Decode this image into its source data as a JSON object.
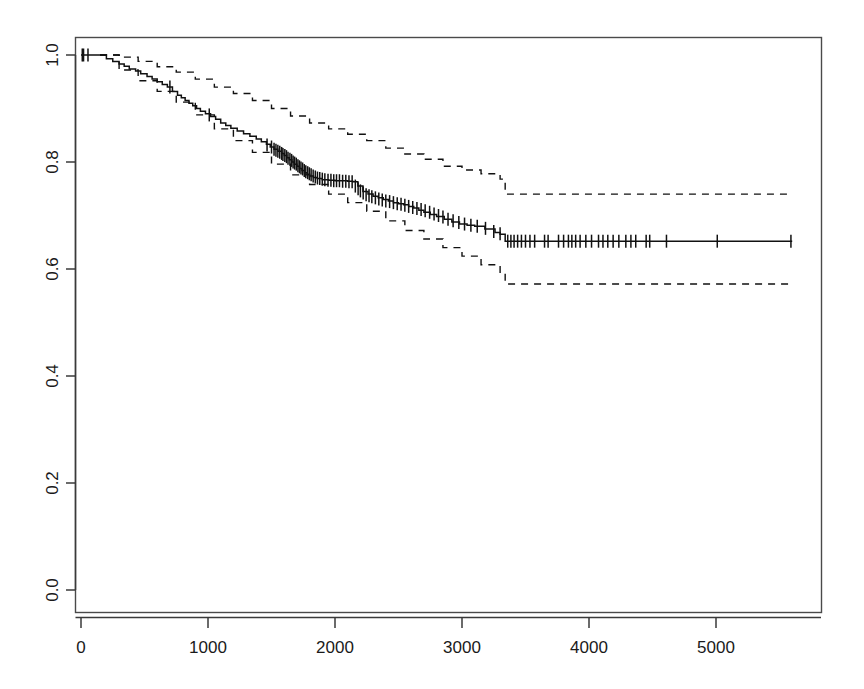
{
  "figure": {
    "title": "",
    "width": 864,
    "height": 689,
    "background": "#ffffff",
    "line_color": "#111111",
    "axis_color": "#3a3a3a"
  },
  "axes": {
    "x_ticks": [
      "0",
      "1000",
      "2000",
      "3000",
      "4000",
      "5000"
    ],
    "y_ticks": [
      "0.0",
      "0.2",
      "0.4",
      "0.6",
      "0.8",
      "1.0"
    ],
    "xlabel": "",
    "ylabel": ""
  },
  "chart_data": {
    "type": "line",
    "title": "",
    "xlabel": "",
    "ylabel": "",
    "xlim": [
      -180,
      5700
    ],
    "ylim": [
      -0.035,
      1.06
    ],
    "grid": false,
    "legend": null,
    "x_ticks": [
      0,
      1000,
      2000,
      3000,
      4000,
      5000
    ],
    "y_ticks": [
      0.0,
      0.2,
      0.4,
      0.6,
      0.8,
      1.0
    ],
    "series": [
      {
        "name": "survival",
        "style": "step",
        "linestyle": "solid",
        "x": [
          0,
          150,
          200,
          250,
          300,
          340,
          380,
          430,
          470,
          520,
          560,
          600,
          640,
          680,
          720,
          760,
          790,
          820,
          850,
          880,
          910,
          940,
          980,
          1020,
          1060,
          1100,
          1140,
          1180,
          1230,
          1280,
          1330,
          1380,
          1420,
          1460,
          1490,
          1520,
          1550,
          1580,
          1600,
          1620,
          1640,
          1660,
          1680,
          1700,
          1720,
          1740,
          1760,
          1780,
          1800,
          1830,
          1860,
          1900,
          1950,
          2000,
          2050,
          2100,
          2140,
          2180,
          2220,
          2260,
          2300,
          2340,
          2380,
          2420,
          2460,
          2500,
          2540,
          2580,
          2620,
          2660,
          2700,
          2750,
          2800,
          2860,
          2920,
          2980,
          3040,
          3100,
          3180,
          3260,
          3300,
          3340,
          5600
        ],
        "y": [
          1.0,
          1.0,
          0.993,
          0.988,
          0.983,
          0.979,
          0.974,
          0.97,
          0.965,
          0.96,
          0.955,
          0.95,
          0.945,
          0.94,
          0.932,
          0.925,
          0.92,
          0.915,
          0.91,
          0.905,
          0.9,
          0.895,
          0.89,
          0.885,
          0.88,
          0.873,
          0.868,
          0.863,
          0.858,
          0.853,
          0.848,
          0.843,
          0.838,
          0.833,
          0.828,
          0.824,
          0.82,
          0.816,
          0.812,
          0.808,
          0.804,
          0.8,
          0.796,
          0.792,
          0.788,
          0.784,
          0.78,
          0.777,
          0.774,
          0.771,
          0.769,
          0.767,
          0.766,
          0.765,
          0.765,
          0.764,
          0.763,
          0.755,
          0.745,
          0.74,
          0.736,
          0.733,
          0.73,
          0.727,
          0.724,
          0.722,
          0.72,
          0.717,
          0.714,
          0.71,
          0.706,
          0.702,
          0.698,
          0.693,
          0.688,
          0.684,
          0.682,
          0.68,
          0.675,
          0.668,
          0.665,
          0.652,
          0.652
        ]
      },
      {
        "name": "upper_95_ci",
        "style": "step",
        "linestyle": "dashed",
        "x": [
          150,
          300,
          450,
          600,
          750,
          900,
          1050,
          1200,
          1350,
          1500,
          1650,
          1800,
          1950,
          2100,
          2250,
          2400,
          2550,
          2700,
          2850,
          3000,
          3150,
          3300,
          3340,
          5600
        ],
        "y": [
          1.0,
          0.996,
          0.988,
          0.978,
          0.968,
          0.955,
          0.94,
          0.928,
          0.915,
          0.9,
          0.886,
          0.873,
          0.862,
          0.852,
          0.84,
          0.826,
          0.815,
          0.805,
          0.792,
          0.785,
          0.778,
          0.768,
          0.74,
          0.74
        ]
      },
      {
        "name": "lower_95_ci",
        "style": "step",
        "linestyle": "dashed",
        "x": [
          150,
          300,
          450,
          600,
          750,
          900,
          1050,
          1200,
          1350,
          1500,
          1650,
          1800,
          1950,
          2100,
          2250,
          2400,
          2550,
          2700,
          2850,
          3000,
          3150,
          3300,
          3340,
          5600
        ],
        "y": [
          1.0,
          0.972,
          0.952,
          0.932,
          0.912,
          0.888,
          0.862,
          0.84,
          0.818,
          0.796,
          0.776,
          0.758,
          0.74,
          0.724,
          0.708,
          0.69,
          0.672,
          0.656,
          0.64,
          0.624,
          0.608,
          0.592,
          0.572,
          0.572
        ]
      }
    ],
    "censoring_marks": {
      "label": "censored observations",
      "marker": "+",
      "points": [
        [
          10,
          1.0
        ],
        [
          20,
          1.0
        ],
        [
          55,
          1.0
        ],
        [
          700,
          0.94
        ],
        [
          1010,
          0.888
        ],
        [
          1465,
          0.832
        ],
        [
          1500,
          0.828
        ],
        [
          1520,
          0.824
        ],
        [
          1535,
          0.822
        ],
        [
          1550,
          0.82
        ],
        [
          1565,
          0.818
        ],
        [
          1580,
          0.816
        ],
        [
          1590,
          0.814
        ],
        [
          1605,
          0.812
        ],
        [
          1618,
          0.81
        ],
        [
          1630,
          0.807
        ],
        [
          1645,
          0.805
        ],
        [
          1658,
          0.803
        ],
        [
          1670,
          0.8
        ],
        [
          1682,
          0.798
        ],
        [
          1695,
          0.796
        ],
        [
          1708,
          0.793
        ],
        [
          1720,
          0.791
        ],
        [
          1732,
          0.789
        ],
        [
          1745,
          0.787
        ],
        [
          1758,
          0.784
        ],
        [
          1770,
          0.782
        ],
        [
          1785,
          0.78
        ],
        [
          1798,
          0.778
        ],
        [
          1812,
          0.776
        ],
        [
          1828,
          0.774
        ],
        [
          1845,
          0.772
        ],
        [
          1862,
          0.77
        ],
        [
          1880,
          0.769
        ],
        [
          1900,
          0.768
        ],
        [
          1920,
          0.767
        ],
        [
          1945,
          0.766
        ],
        [
          1968,
          0.766
        ],
        [
          1990,
          0.765
        ],
        [
          2012,
          0.765
        ],
        [
          2035,
          0.765
        ],
        [
          2060,
          0.764
        ],
        [
          2085,
          0.764
        ],
        [
          2110,
          0.763
        ],
        [
          2135,
          0.763
        ],
        [
          2160,
          0.755
        ],
        [
          2182,
          0.75
        ],
        [
          2200,
          0.746
        ],
        [
          2222,
          0.742
        ],
        [
          2245,
          0.739
        ],
        [
          2268,
          0.737
        ],
        [
          2290,
          0.735
        ],
        [
          2318,
          0.733
        ],
        [
          2345,
          0.731
        ],
        [
          2372,
          0.729
        ],
        [
          2400,
          0.727
        ],
        [
          2430,
          0.726
        ],
        [
          2460,
          0.724
        ],
        [
          2490,
          0.722
        ],
        [
          2520,
          0.721
        ],
        [
          2550,
          0.719
        ],
        [
          2580,
          0.717
        ],
        [
          2612,
          0.715
        ],
        [
          2645,
          0.713
        ],
        [
          2678,
          0.711
        ],
        [
          2710,
          0.709
        ],
        [
          2745,
          0.706
        ],
        [
          2780,
          0.703
        ],
        [
          2815,
          0.7
        ],
        [
          2850,
          0.697
        ],
        [
          2890,
          0.693
        ],
        [
          2930,
          0.69
        ],
        [
          2975,
          0.687
        ],
        [
          3020,
          0.684
        ],
        [
          3070,
          0.682
        ],
        [
          3120,
          0.68
        ],
        [
          3185,
          0.676
        ],
        [
          3250,
          0.67
        ],
        [
          3300,
          0.666
        ],
        [
          3360,
          0.652
        ],
        [
          3385,
          0.652
        ],
        [
          3410,
          0.652
        ],
        [
          3438,
          0.652
        ],
        [
          3468,
          0.652
        ],
        [
          3500,
          0.652
        ],
        [
          3535,
          0.652
        ],
        [
          3572,
          0.652
        ],
        [
          3650,
          0.652
        ],
        [
          3678,
          0.652
        ],
        [
          3760,
          0.652
        ],
        [
          3800,
          0.652
        ],
        [
          3838,
          0.652
        ],
        [
          3865,
          0.652
        ],
        [
          3895,
          0.652
        ],
        [
          3930,
          0.652
        ],
        [
          3975,
          0.652
        ],
        [
          4020,
          0.652
        ],
        [
          4075,
          0.652
        ],
        [
          4110,
          0.652
        ],
        [
          4148,
          0.652
        ],
        [
          4190,
          0.652
        ],
        [
          4235,
          0.652
        ],
        [
          4290,
          0.652
        ],
        [
          4330,
          0.652
        ],
        [
          4368,
          0.652
        ],
        [
          4450,
          0.652
        ],
        [
          4478,
          0.652
        ],
        [
          4610,
          0.652
        ],
        [
          5010,
          0.652
        ],
        [
          5590,
          0.652
        ]
      ]
    }
  }
}
